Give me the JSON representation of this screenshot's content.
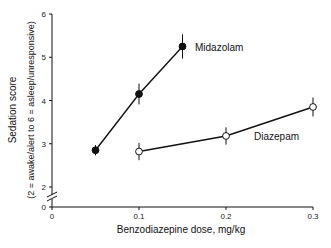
{
  "chart_data": {
    "type": "line",
    "title": "",
    "xlabel": "Benzodiazepine dose, mg/kg",
    "ylabel": "Sedation score",
    "ylabel_sub": "(2 = awake/alert to 6 = asleep/unresponsive)",
    "xlim": [
      0,
      0.3
    ],
    "ylim": [
      0,
      6
    ],
    "y_axis_break": "between 0 and 2",
    "x_ticks": [
      0,
      0.1,
      0.2,
      0.3
    ],
    "x_tick_labels": [
      "0",
      "0.1",
      "0.2",
      "0.3"
    ],
    "y_ticks": [
      0,
      2,
      3,
      4,
      5,
      6
    ],
    "y_tick_labels": [
      "0",
      "2",
      "3",
      "4",
      "5",
      "6"
    ],
    "grid": false,
    "legend": "inline labels next to series",
    "series": [
      {
        "name": "Midazolam",
        "marker": "filled-circle",
        "x": [
          0.05,
          0.1,
          0.15
        ],
        "values": [
          2.85,
          4.15,
          5.25
        ],
        "error": [
          0.12,
          0.24,
          0.28
        ]
      },
      {
        "name": "Diazepam",
        "marker": "open-circle",
        "x": [
          0.1,
          0.2,
          0.3
        ],
        "values": [
          2.82,
          3.18,
          3.85
        ],
        "error": [
          0.2,
          0.2,
          0.22
        ]
      }
    ]
  }
}
